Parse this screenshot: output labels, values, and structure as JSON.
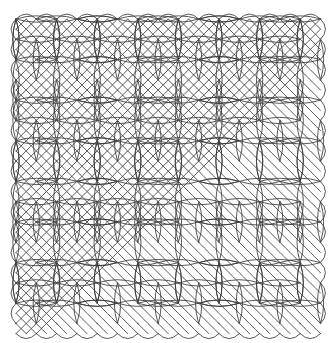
{
  "artwork": {
    "title": "Kolam Lattice Pattern",
    "type": "line-drawing",
    "description": "Interwoven loop lattice (kolam / sona style) drawn around a square dot grid",
    "background_color": "#ffffff",
    "stroke_color": "#3a3a3a",
    "dot_color": "#555555",
    "stroke_width": 0.85,
    "canvas": {
      "width": 333,
      "height": 343
    }
  },
  "grid": {
    "origin_x": 16,
    "origin_y": 19,
    "pitch": 20.3,
    "columns": 15,
    "rows": 15.5,
    "dot_radius": 0.75,
    "dot_label": "grid-dot"
  },
  "pattern": {
    "diagonal_mesh": {
      "name": "diamond-weave",
      "enabled": true,
      "description": "Two families of sinusoidal diagonal strands crossing to form diamonds",
      "amplitude": 10.15,
      "phase_step": 1
    },
    "lenses": {
      "name": "lens-loops",
      "enabled": true,
      "horizontal_label": "horizontal-lens",
      "vertical_label": "vertical-lens",
      "lens_half_length": 20.3,
      "lens_half_width": 6.4,
      "description": "Eye/lens shaped closed loops placed on alternating lattice cells"
    },
    "border": {
      "name": "scalloped-border",
      "enabled": true,
      "description": "Arcs turning back at the boundary creating scallops on all four sides"
    }
  },
  "layout": {
    "pattern_left": 15,
    "pattern_top": 18,
    "pattern_right": 320,
    "pattern_bottom": 330,
    "margin_note": "white margin on all sides"
  }
}
